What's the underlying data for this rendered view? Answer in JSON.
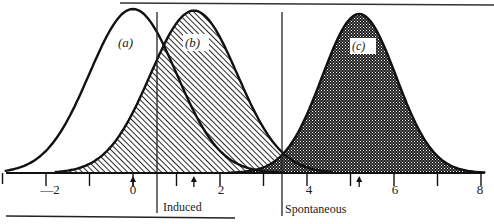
{
  "chart_data": {
    "type": "area",
    "title": "",
    "xlabel": "",
    "ylabel": "",
    "xlim": [
      -3,
      8.2
    ],
    "x_ticks": [
      -3,
      -2,
      -1,
      0,
      1,
      2,
      3,
      4,
      5,
      6,
      7,
      8
    ],
    "x_tick_labels": [
      {
        "value": -2,
        "label": "—2"
      },
      {
        "value": 0,
        "label": "0"
      },
      {
        "value": 2,
        "label": "2"
      },
      {
        "value": 4,
        "label": "4"
      },
      {
        "value": 6,
        "label": "6"
      },
      {
        "value": 8,
        "label": "8"
      }
    ],
    "grid": false,
    "series": [
      {
        "name": "(a)",
        "label": "(a)",
        "mean": 0.0,
        "sd": 1.0,
        "fill": "none",
        "arrow_at": 0.0,
        "peak_relative_height": 1.0
      },
      {
        "name": "(b)",
        "label": "(b)",
        "mean": 1.4,
        "sd": 1.0,
        "fill": "diagonal-hatch",
        "arrow_at": 1.4,
        "peak_relative_height": 0.99
      },
      {
        "name": "(c)",
        "label": "(c)",
        "mean": 5.2,
        "sd": 0.85,
        "fill": "dense-crosshatch",
        "arrow_at": 5.2,
        "peak_relative_height": 0.97
      }
    ],
    "thresholds": [
      {
        "name": "Induced",
        "label": "Induced",
        "x": 0.55
      },
      {
        "name": "Spontaneous",
        "label": "Spontaneous",
        "x": 3.4
      }
    ],
    "annotations": [
      "(a)",
      "(b)",
      "(c)",
      "Induced",
      "Spontaneous"
    ]
  },
  "labels": {
    "a": "(a)",
    "b": "(b)",
    "c": "(c)",
    "induced": "Induced",
    "spontaneous": "Spontaneous",
    "tick_m2": "—2",
    "tick_0": "0",
    "tick_2": "2",
    "tick_4": "4",
    "tick_6": "6",
    "tick_8": "8"
  },
  "colors": {
    "ink": "#1a1a1a",
    "paper": "#ffffff"
  }
}
